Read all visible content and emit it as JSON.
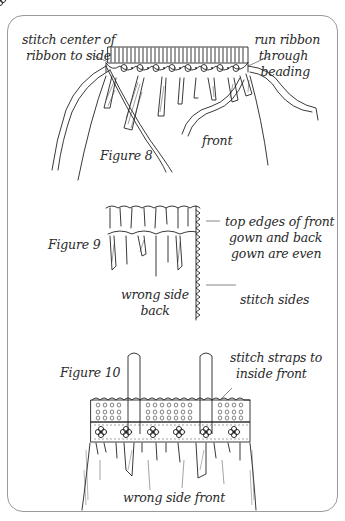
{
  "figures": [
    {
      "id": "figure-8",
      "caption": "Figure 8",
      "labels": {
        "stitch_center": [
          "stitch center of",
          "ribbon to side"
        ],
        "run_ribbon": [
          "run ribbon",
          "through",
          "beading"
        ],
        "front": "front"
      }
    },
    {
      "id": "figure-9",
      "caption": "Figure 9",
      "labels": {
        "top_edges": [
          "top edges of front",
          "gown and back",
          "gown are even"
        ],
        "wrong_side_back": [
          "wrong side",
          "back"
        ],
        "stitch_sides": "stitch sides"
      }
    },
    {
      "id": "figure-10",
      "caption": "Figure 10",
      "labels": {
        "stitch_straps": [
          "stitch straps to",
          "inside front"
        ],
        "wrong_side_front": "wrong side front"
      }
    }
  ],
  "colors": {
    "ink": "#222222",
    "frame": "#9a9a9a",
    "background": "#ffffff"
  }
}
